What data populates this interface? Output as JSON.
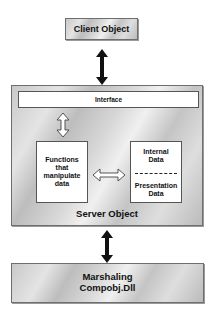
{
  "diagram": {
    "client": {
      "label": "Client Object"
    },
    "server": {
      "label": "Server Object",
      "interface": {
        "label": "Interface"
      },
      "functions": {
        "lines": [
          "Functions",
          "that",
          "manipulate",
          "data"
        ]
      },
      "data": {
        "internal": [
          "Internal",
          "Data"
        ],
        "presentation": [
          "Presentation",
          "Data"
        ]
      }
    },
    "marshaling": {
      "lines": [
        "Marshaling",
        "Compobj.Dll"
      ]
    },
    "connectors": [
      {
        "from": "Client Object",
        "to": "Server Object",
        "style": "solid-double-arrow"
      },
      {
        "from": "Interface",
        "to": "Functions that manipulate data",
        "style": "hollow-double-arrow"
      },
      {
        "from": "Functions that manipulate data",
        "to": "Internal/Presentation Data",
        "style": "hollow-double-arrow"
      },
      {
        "from": "Server Object",
        "to": "Marshaling Compobj.Dll",
        "style": "solid-double-arrow"
      }
    ],
    "colors": {
      "box_fill": "#d4d4d4",
      "border": "#6e6e6e",
      "inner_fill": "#ffffff",
      "text": "#111111"
    }
  }
}
